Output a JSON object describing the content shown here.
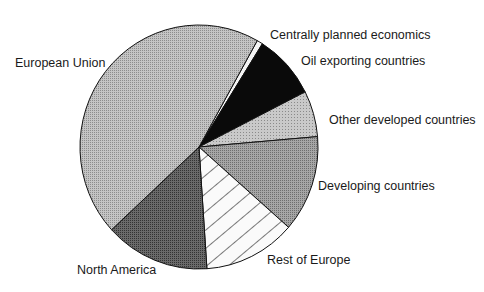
{
  "chart_data": {
    "type": "pie",
    "title": "",
    "start_angle_deg": 29.3,
    "direction": "clockwise",
    "slices": [
      {
        "label": "Centrally planned economics",
        "value": 0.8,
        "pattern": "white",
        "label_pos": [
          270,
          29
        ]
      },
      {
        "label": "Oil exporting countries",
        "value": 8.6,
        "pattern": "black",
        "label_pos": [
          301,
          55
        ]
      },
      {
        "label": "Other developed countries",
        "value": 6.1,
        "pattern": "light-dots",
        "label_pos": [
          329,
          114
        ]
      },
      {
        "label": "Developing countries",
        "value": 12.8,
        "pattern": "medium-dots",
        "label_pos": [
          318,
          180
        ]
      },
      {
        "label": "Rest of Europe",
        "value": 12.5,
        "pattern": "hatch",
        "label_pos": [
          267,
          254
        ]
      },
      {
        "label": "North America",
        "value": 14.2,
        "pattern": "dark-dots",
        "label_pos": [
          77,
          264
        ]
      },
      {
        "label": "European Union",
        "value": 45.0,
        "pattern": "light-medium-dots",
        "label_pos": [
          15,
          57
        ]
      }
    ],
    "legend": "none (direct labels)",
    "units": "percent (estimated)"
  },
  "labels": {
    "centrally_planned": "Centrally planned economics",
    "oil_exporting": "Oil exporting countries",
    "other_developed": "Other developed countries",
    "developing": "Developing countries",
    "rest_of_europe": "Rest of Europe",
    "north_america": "North America",
    "european_union": "European Union"
  }
}
